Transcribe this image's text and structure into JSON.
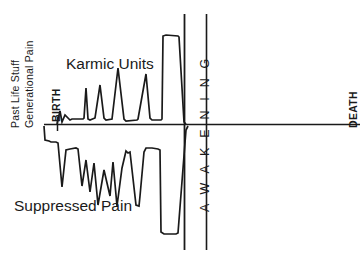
{
  "figure": {
    "axis_label_left_line1": "Past Life Stuff",
    "axis_label_left_line2": "Generational Pain",
    "marker_birth": "BIRTH",
    "marker_death": "DEATH",
    "marker_awakening": "A W A K E N I N G",
    "series_upper_label": "Karmic Units",
    "series_lower_label": "Suppressed Pain",
    "stroke_color": "#1a1a1a",
    "background_color": "#ffffff"
  },
  "chart_data": {
    "type": "line",
    "title": "",
    "xlabel": "",
    "ylabel": "Past Life Stuff / Generational Pain",
    "grid": false,
    "legend": "inline-annotations",
    "baseline_y": 0,
    "xlim": [
      0,
      360
    ],
    "ylim": [
      -140,
      120
    ],
    "annotations": [
      {
        "text": "Past Life Stuff",
        "x": 14,
        "y": 60,
        "orientation": "vertical"
      },
      {
        "text": "Generational Pain",
        "x": 28,
        "y": 60,
        "orientation": "vertical"
      },
      {
        "text": "BIRTH",
        "x": 55,
        "y": 95,
        "orientation": "vertical"
      },
      {
        "text": "Karmic Units",
        "x": 66,
        "y": 55,
        "orientation": "horizontal"
      },
      {
        "text": "Suppressed Pain",
        "x": 14,
        "y": 197,
        "orientation": "horizontal"
      },
      {
        "text": "A W A K E N I N G",
        "x": 198,
        "y": 130,
        "orientation": "vertical"
      },
      {
        "text": "DEATH",
        "x": 347,
        "y": 95,
        "orientation": "vertical"
      }
    ],
    "reference_lines": [
      {
        "name": "baseline",
        "orientation": "horizontal",
        "y": 124,
        "x_from": 44,
        "x_to": 360
      },
      {
        "name": "birth-tick",
        "orientation": "vertical",
        "x": 57,
        "y_from": 117,
        "y_to": 131
      },
      {
        "name": "awakening-line-1",
        "orientation": "vertical",
        "x": 184,
        "y_from": 14,
        "y_to": 250
      },
      {
        "name": "awakening-line-2",
        "orientation": "vertical",
        "x": 206,
        "y_from": 14,
        "y_to": 250
      }
    ],
    "series": [
      {
        "name": "Karmic Units",
        "description": "Upper jagged waveform above the baseline, rising in amplitude toward awakening",
        "points": [
          [
            57,
            124
          ],
          [
            60,
            111
          ],
          [
            62,
            122
          ],
          [
            65,
            115
          ],
          [
            70,
            120
          ],
          [
            72,
            119
          ],
          [
            83,
            119
          ],
          [
            84,
            118
          ],
          [
            86,
            88
          ],
          [
            88,
            119
          ],
          [
            90,
            120
          ],
          [
            95,
            118
          ],
          [
            100,
            85
          ],
          [
            104,
            118
          ],
          [
            106,
            120
          ],
          [
            112,
            119
          ],
          [
            118,
            68
          ],
          [
            124,
            119
          ],
          [
            126,
            121
          ],
          [
            137,
            120
          ],
          [
            138,
            119
          ],
          [
            146,
            74
          ],
          [
            150,
            118
          ],
          [
            152,
            120
          ],
          [
            161,
            120
          ],
          [
            162,
            119
          ],
          [
            163,
            36
          ],
          [
            166,
            35
          ],
          [
            178,
            36
          ],
          [
            179,
            37
          ],
          [
            184,
            122
          ],
          [
            186,
            124
          ]
        ]
      },
      {
        "name": "Suppressed Pain",
        "description": "Lower jagged waveform below the baseline, deepening toward awakening",
        "points": [
          [
            44,
            126
          ],
          [
            45,
            140
          ],
          [
            49,
            141
          ],
          [
            51,
            142
          ],
          [
            56,
            142
          ],
          [
            58,
            143
          ],
          [
            62,
            187
          ],
          [
            66,
            150
          ],
          [
            70,
            149
          ],
          [
            76,
            148
          ],
          [
            78,
            149
          ],
          [
            82,
            186
          ],
          [
            86,
            160
          ],
          [
            90,
            192
          ],
          [
            94,
            163
          ],
          [
            98,
            205
          ],
          [
            104,
            170
          ],
          [
            110,
            196
          ],
          [
            113,
            162
          ],
          [
            117,
            206
          ],
          [
            122,
            168
          ],
          [
            126,
            151
          ],
          [
            128,
            153
          ],
          [
            130,
            152
          ],
          [
            136,
            205
          ],
          [
            139,
            206
          ],
          [
            140,
            196
          ],
          [
            144,
            152
          ],
          [
            146,
            148
          ],
          [
            152,
            148
          ],
          [
            158,
            149
          ],
          [
            160,
            150
          ],
          [
            161,
            232
          ],
          [
            164,
            234
          ],
          [
            176,
            234
          ],
          [
            178,
            233
          ],
          [
            186,
            130
          ],
          [
            188,
            126
          ]
        ]
      }
    ]
  }
}
